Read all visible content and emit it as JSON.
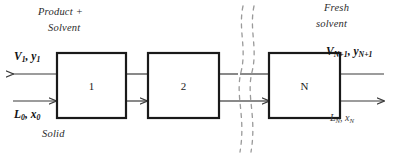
{
  "figure": {
    "background_color": "#ffffff",
    "line_color": "#3a3a3a",
    "box_stroke_color": "#1a1a1a",
    "break_line_color": "#9a9a9a"
  },
  "stages": [
    {
      "id": "stage-1",
      "label": "1"
    },
    {
      "id": "stage-2",
      "label": "2"
    },
    {
      "id": "stage-n",
      "label": "N"
    }
  ],
  "captions": {
    "product_line1": "Product +",
    "product_line2": "Solvent",
    "solid": "Solid",
    "fresh_line1": "Fresh",
    "fresh_line2": "solvent"
  },
  "streams": {
    "overflow_out": {
      "symbol": "V",
      "sub": "1",
      "symbol2": "y",
      "sub2": "1"
    },
    "underflow_in": {
      "symbol": "L",
      "sub": "0",
      "symbol2": "x",
      "sub2": "0"
    },
    "solvent_in": {
      "symbol": "V",
      "sub": "N+1",
      "symbol2": "y",
      "sub2": "N+1"
    },
    "underflow_out": {
      "symbol": "L",
      "sub": "N",
      "symbol2": "x",
      "sub2": "N"
    }
  }
}
